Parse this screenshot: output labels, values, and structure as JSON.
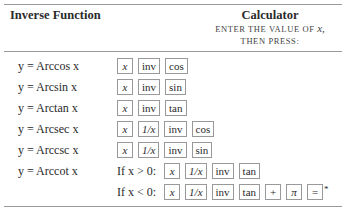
{
  "header": {
    "left_title": "Inverse Function",
    "right_title": "Calculator",
    "right_sub1": "ENTER THE VALUE OF",
    "right_sub1_var": "x,",
    "right_sub2": "THEN PRESS:"
  },
  "rows": [
    {
      "fn": "y = Arccos x",
      "cond": "",
      "keys": [
        "x",
        "inv",
        "cos"
      ]
    },
    {
      "fn": "y = Arcsin x",
      "cond": "",
      "keys": [
        "x",
        "inv",
        "sin"
      ]
    },
    {
      "fn": "y = Arctan x",
      "cond": "",
      "keys": [
        "x",
        "inv",
        "tan"
      ]
    },
    {
      "fn": "y = Arcsec x",
      "cond": "",
      "keys": [
        "x",
        "1/x",
        "inv",
        "cos"
      ]
    },
    {
      "fn": "y = Arccsc x",
      "cond": "",
      "keys": [
        "x",
        "1/x",
        "inv",
        "sin"
      ]
    },
    {
      "fn": "y = Arccot x",
      "cond": "If x > 0:",
      "keys": [
        "x",
        "1/x",
        "inv",
        "tan"
      ]
    },
    {
      "fn": "",
      "cond": "If x < 0:",
      "keys": [
        "x",
        "1/x",
        "inv",
        "tan",
        "+",
        "π",
        "="
      ],
      "footnote_mark": "*"
    }
  ]
}
